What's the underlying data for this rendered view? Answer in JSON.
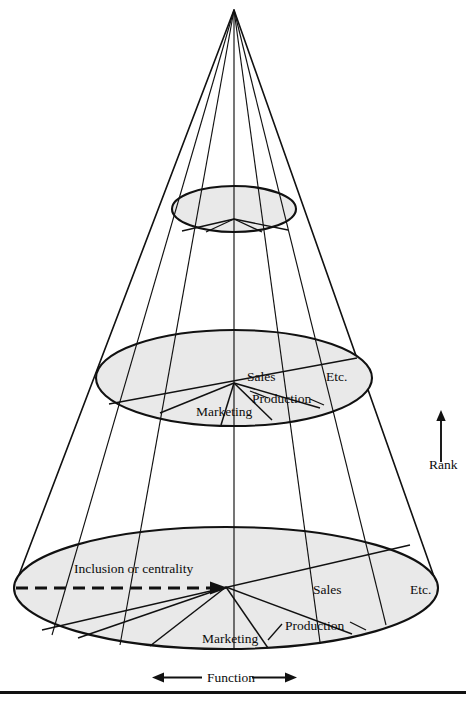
{
  "figure": {
    "type": "cone-diagram",
    "background": "#ffffff",
    "ink_color": "#111111",
    "ellipse_fill": "#e9e9e9",
    "axes": {
      "vertical": {
        "label": "Rank",
        "direction": "up",
        "icon": "arrow-up-icon"
      },
      "horizontal": {
        "label": "Function",
        "direction": "both",
        "icon": "arrow-left-right-icon"
      }
    },
    "levels": [
      {
        "name": "apex",
        "sectors": []
      },
      {
        "name": "upper-disc",
        "sectors": []
      },
      {
        "name": "middle-disc",
        "sectors": [
          {
            "label": "Marketing"
          },
          {
            "label": "Production"
          },
          {
            "label": "Sales"
          },
          {
            "label": "Etc."
          }
        ]
      },
      {
        "name": "base-disc",
        "sectors": [
          {
            "label": "Marketing"
          },
          {
            "label": "Production"
          },
          {
            "label": "Sales"
          },
          {
            "label": "Etc."
          }
        ],
        "radial_annotation": {
          "label": "Inclusion or centrality",
          "icon": "dashed-arrow-right-icon"
        }
      }
    ],
    "labels": {
      "middle": {
        "sales": "Sales",
        "etc": "Etc.",
        "production": "Production",
        "marketing": "Marketing"
      },
      "base": {
        "inclusion": "Inclusion or centrality",
        "sales": "Sales",
        "etc": "Etc.",
        "production": "Production",
        "marketing": "Marketing"
      },
      "rank": "Rank",
      "function": "Function"
    }
  }
}
